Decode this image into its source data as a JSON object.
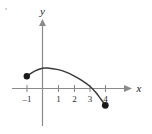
{
  "figure": {
    "background_color": "#ffffff",
    "axis_color": "#8a8a8a",
    "curve_color": "#3a3a3a",
    "point_color": "#1a1a1a",
    "x_axis_label": "x",
    "y_axis_label": "y"
  },
  "chart_data": {
    "type": "line",
    "title": "",
    "xlabel": "x",
    "ylabel": "y",
    "grid": false,
    "legend": null,
    "xlim": [
      -2,
      5
    ],
    "ylim": [
      -2,
      3
    ],
    "x_ticks": [
      -1,
      1,
      2,
      3,
      4
    ],
    "x_tick_labels": [
      "–1",
      "1",
      "2",
      "3",
      "4"
    ],
    "y_ticks": [],
    "y_tick_labels": [],
    "series": [
      {
        "name": "curve",
        "description": "downward-opening concave curve from closed left endpoint to closed right endpoint",
        "x": [
          -1,
          -0.5,
          0,
          0.3,
          1,
          1.5,
          2,
          2.5,
          3,
          3.4,
          3.7,
          4
        ],
        "y": [
          0.6,
          0.85,
          0.99,
          1.0,
          0.92,
          0.8,
          0.62,
          0.4,
          0.12,
          -0.2,
          -0.5,
          -0.82
        ]
      }
    ],
    "points": [
      {
        "name": "left-endpoint",
        "x": -1,
        "y": 0.6,
        "style": "closed"
      },
      {
        "name": "right-endpoint",
        "x": 4,
        "y": -0.82,
        "style": "closed"
      }
    ],
    "x_intercepts": [
      3.4
    ]
  },
  "ticks": {
    "labels": [
      "–1",
      "1",
      "2",
      "3",
      "4"
    ]
  }
}
